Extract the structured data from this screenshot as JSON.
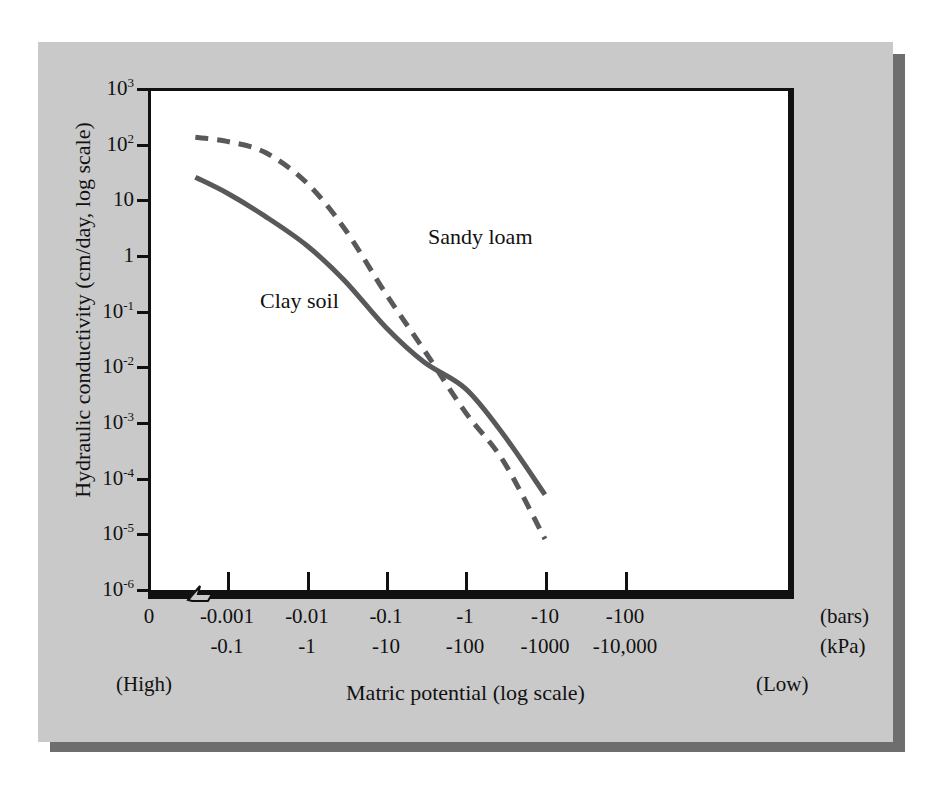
{
  "figure": {
    "background_color": "#c9c9c9",
    "plot_background_color": "#ffffff",
    "axis_color": "#111111",
    "curve_color": "#59595c"
  },
  "chart_data": {
    "type": "line",
    "title": "",
    "xlabel": "Matric potential (log scale)",
    "ylabel": "Hydraulic conductivity (cm/day, log scale)",
    "x_axis": {
      "primary_unit": "(bars)",
      "secondary_unit": "(kPa)",
      "tick_labels_bars": [
        "0",
        "-0.001",
        "-0.01",
        "-0.1",
        "-1",
        "-10",
        "-100"
      ],
      "tick_labels_kpa": [
        "",
        "-0.1",
        "-1",
        "-10",
        "-100",
        "-1000",
        "-10,000"
      ],
      "end_annotation_left": "(High)",
      "end_annotation_right": "(Low)",
      "has_axis_break": true,
      "scale": "log"
    },
    "y_axis": {
      "tick_labels": [
        "10³",
        "10²",
        "10",
        "1",
        "10⁻¹",
        "10⁻²",
        "10⁻³",
        "10⁻⁴",
        "10⁻⁵",
        "10⁻⁶"
      ],
      "tick_values": [
        1000,
        100,
        10,
        1,
        0.1,
        0.01,
        0.001,
        0.0001,
        1e-05,
        1e-06
      ],
      "ylim": [
        1e-06,
        1000
      ],
      "scale": "log"
    },
    "grid": false,
    "legend_position": "inline-annotations",
    "series": [
      {
        "name": "Clay soil",
        "style": "solid",
        "color": "#59595c",
        "label_position": "inline",
        "points": [
          {
            "x_bars": -0.0004,
            "y": 25
          },
          {
            "x_bars": -0.001,
            "y": 13
          },
          {
            "x_bars": -0.003,
            "y": 5
          },
          {
            "x_bars": -0.01,
            "y": 1.5
          },
          {
            "x_bars": -0.03,
            "y": 0.35
          },
          {
            "x_bars": -0.1,
            "y": 0.05
          },
          {
            "x_bars": -0.3,
            "y": 0.012
          },
          {
            "x_bars": -1,
            "y": 0.004
          },
          {
            "x_bars": -3,
            "y": 0.0006
          },
          {
            "x_bars": -10,
            "y": 5e-05
          }
        ]
      },
      {
        "name": "Sandy loam",
        "style": "dashed",
        "color": "#59595c",
        "label_position": "inline",
        "points": [
          {
            "x_bars": -0.0004,
            "y": 130
          },
          {
            "x_bars": -0.001,
            "y": 110
          },
          {
            "x_bars": -0.003,
            "y": 70
          },
          {
            "x_bars": -0.01,
            "y": 20
          },
          {
            "x_bars": -0.03,
            "y": 3
          },
          {
            "x_bars": -0.1,
            "y": 0.2
          },
          {
            "x_bars": -0.3,
            "y": 0.02
          },
          {
            "x_bars": -1,
            "y": 0.0015
          },
          {
            "x_bars": -3,
            "y": 0.0002
          },
          {
            "x_bars": -10,
            "y": 8e-06
          }
        ]
      }
    ],
    "annotations": [
      {
        "text": "Clay soil",
        "series": "Clay soil"
      },
      {
        "text": "Sandy loam",
        "series": "Sandy loam"
      }
    ]
  },
  "ticks": {
    "y": [
      {
        "label": "10",
        "exp": "3"
      },
      {
        "label": "10",
        "exp": "2"
      },
      {
        "label": "10",
        "exp": ""
      },
      {
        "label": "1",
        "exp": ""
      },
      {
        "label": "10",
        "exp": "-1"
      },
      {
        "label": "10",
        "exp": "-2"
      },
      {
        "label": "10",
        "exp": "-3"
      },
      {
        "label": "10",
        "exp": "-4"
      },
      {
        "label": "10",
        "exp": "-5"
      },
      {
        "label": "10",
        "exp": "-6"
      }
    ],
    "x_bars": [
      "0",
      "-0.001",
      "-0.01",
      "-0.1",
      "-1",
      "-10",
      "-100"
    ],
    "x_kpa": [
      "-0.1",
      "-1",
      "-10",
      "-100",
      "-1000",
      "-10,000"
    ]
  },
  "labels": {
    "unit_bars": "(bars)",
    "unit_kpa": "(kPa)",
    "high": "(High)",
    "low": "(Low)",
    "x_title": "Matric potential (log scale)",
    "y_title": "Hydraulic conductivity (cm/day, log scale)",
    "series_clay": "Clay soil",
    "series_sandy": "Sandy loam"
  }
}
